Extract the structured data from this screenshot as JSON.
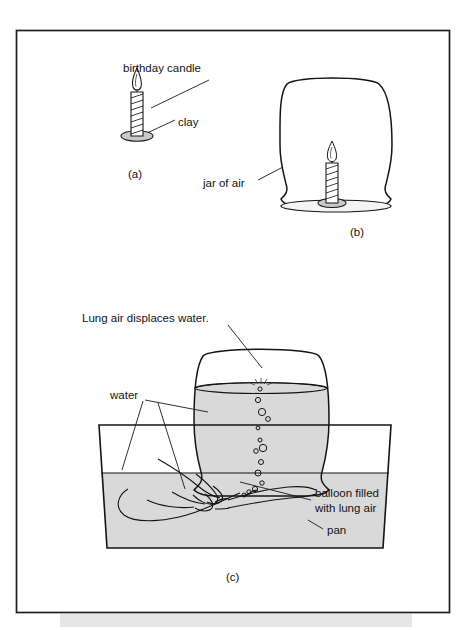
{
  "figure": {
    "background_color": "#ffffff",
    "frame": {
      "stroke_color": "#1f1f1f",
      "x": 16,
      "y": 30,
      "width": 434,
      "height": 583
    },
    "bottom_strip_color": "#e2e2e2"
  },
  "colors": {
    "ink": "#141414",
    "water_gray": "#d9d9d9",
    "clay_gray": "#c9c9c9",
    "text": "#131313",
    "leader": "#1a1a1a"
  },
  "panels": [
    {
      "id": "a",
      "label": "(a)",
      "label_x": 128,
      "label_y": 175,
      "caption": "A birthday candle fixed in a lump of clay",
      "annotations": [
        {
          "name": "birthday-candle",
          "text": "birthday candle",
          "x": 123,
          "y": 72
        },
        {
          "name": "clay",
          "text": "clay",
          "x": 178,
          "y": 123
        }
      ]
    },
    {
      "id": "b",
      "label": "(b)",
      "label_x": 352,
      "label_y": 233,
      "caption": "Candle covered by an inverted jar of air",
      "annotations": [
        {
          "name": "jar-of-air",
          "text": "jar of air",
          "x": 206,
          "y": 183
        }
      ]
    },
    {
      "id": "c",
      "label": "(c)",
      "label_x": 228,
      "label_y": 578,
      "caption": "Lung air from a balloon displaces water in the inverted jar",
      "annotations": [
        {
          "name": "lung-air-displaces-water",
          "text": "Lung air displaces water.",
          "x": 82,
          "y": 320
        },
        {
          "name": "water",
          "text": "water",
          "x": 110,
          "y": 396
        },
        {
          "name": "balloon-filled-with-lung-air-line1",
          "text": "balloon filled",
          "x": 315,
          "y": 494
        },
        {
          "name": "balloon-filled-with-lung-air-line2",
          "text": "with lung air",
          "x": 315,
          "y": 509
        },
        {
          "name": "pan",
          "text": "pan",
          "x": 327,
          "y": 531
        }
      ]
    }
  ],
  "objects": {
    "candle_a": {
      "x": 132,
      "y": 90,
      "height": 62,
      "stripes": 7
    },
    "candle_b": {
      "x": 327,
      "y": 152,
      "height": 54,
      "stripes": 7
    },
    "jar_b": {
      "x": 246,
      "y": 80,
      "width": 165,
      "height": 135
    },
    "jar_c": {
      "x": 196,
      "y": 345,
      "width": 130,
      "height": 145
    },
    "pan_c": {
      "x": 98,
      "y": 424,
      "width": 294,
      "height": 125,
      "water_level_y": 473
    },
    "bubbles_count": 14,
    "balloon_c": {
      "x": 128,
      "y": 470,
      "width": 115,
      "height": 55
    }
  }
}
